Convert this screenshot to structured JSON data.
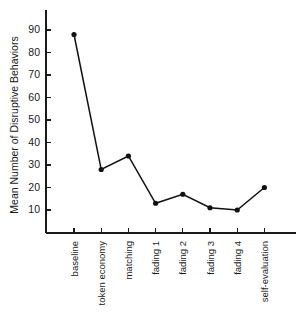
{
  "chart_data": {
    "type": "line",
    "title": "",
    "subtitle": "",
    "xlabel": "",
    "ylabel": "Mean Number of Disruptive Behaviors",
    "categories": [
      "baseline",
      "token economy",
      "matching",
      "fading 1",
      "fading 2",
      "fading 3",
      "fading 4",
      "self-evaluation"
    ],
    "values": [
      88,
      28,
      34,
      13,
      17,
      11,
      10,
      20
    ],
    "series": [
      {
        "name": "Mean Number of Disruptive Behaviors",
        "values": [
          88,
          28,
          34,
          13,
          17,
          11,
          10,
          20
        ]
      }
    ],
    "ylim": [
      0,
      98
    ],
    "yticks": [
      10,
      20,
      30,
      40,
      50,
      60,
      70,
      80,
      90
    ],
    "ytick_labels": [
      "10",
      "20",
      "30",
      "40",
      "50",
      "60",
      "70",
      "80",
      "90"
    ],
    "grid": false,
    "legend": false,
    "legend_position": "none",
    "marker": "filled-circle",
    "line_color": "#111111",
    "marker_color": "#111111",
    "background_color": "#ffffff",
    "xtick_label_rotation": -90
  },
  "figure": {
    "width": 306,
    "height": 325,
    "background": "#ffffff"
  }
}
